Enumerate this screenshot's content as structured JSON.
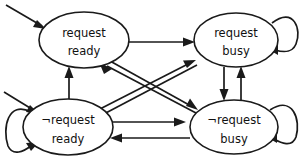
{
  "diagram": {
    "type": "state-transition-diagram",
    "background_color": "#ffffff",
    "stroke_color": "#1a1a1a",
    "canvas": {
      "width": 304,
      "height": 166
    },
    "negation_symbol": "¬",
    "states": [
      {
        "id": "request-ready",
        "line1": "request",
        "line2": "ready",
        "cx": 84,
        "cy": 40,
        "rx": 45,
        "ry": 28,
        "initial": true,
        "self_loop": false
      },
      {
        "id": "request-busy",
        "line1": "request",
        "line2": "busy",
        "cx": 236,
        "cy": 40,
        "rx": 42,
        "ry": 27,
        "initial": false,
        "self_loop": true,
        "self_loop_side": "right"
      },
      {
        "id": "not-request-ready",
        "line1": "¬request",
        "line2": "ready",
        "cx": 68,
        "cy": 127,
        "rx": 45,
        "ry": 28,
        "initial": true,
        "self_loop": true,
        "self_loop_side": "left"
      },
      {
        "id": "not-request-busy",
        "line1": "¬request",
        "line2": "busy",
        "cx": 234,
        "cy": 127,
        "rx": 44,
        "ry": 27,
        "initial": false,
        "self_loop": true,
        "self_loop_side": "right"
      }
    ],
    "transitions": [
      {
        "from": "request-ready",
        "to": "request-busy",
        "shape": "horizontal-top"
      },
      {
        "from": "not-request-ready",
        "to": "not-request-busy",
        "shape": "horizontal-bottom-upper"
      },
      {
        "from": "not-request-busy",
        "to": "not-request-ready",
        "shape": "horizontal-bottom-lower"
      },
      {
        "from": "not-request-ready",
        "to": "request-ready",
        "shape": "vertical-left"
      },
      {
        "from": "request-busy",
        "to": "not-request-busy",
        "shape": "vertical-right-down"
      },
      {
        "from": "not-request-busy",
        "to": "request-busy",
        "shape": "vertical-right-up"
      },
      {
        "from": "request-ready",
        "to": "not-request-busy",
        "shape": "diagonal-down-right"
      },
      {
        "from": "not-request-ready",
        "to": "request-busy",
        "shape": "diagonal-up-right"
      },
      {
        "from": "not-request-busy",
        "to": "request-ready",
        "shape": "diagonal-up-left"
      },
      {
        "from": "request-busy",
        "to": "not-request-ready",
        "shape": "diagonal-down-left"
      },
      {
        "from": "request-busy",
        "to": "request-busy",
        "shape": "self-loop"
      },
      {
        "from": "not-request-ready",
        "to": "not-request-ready",
        "shape": "self-loop"
      },
      {
        "from": "not-request-busy",
        "to": "not-request-busy",
        "shape": "self-loop"
      }
    ],
    "initial_arrows": [
      {
        "target": "request-ready",
        "direction": "from-upper-left"
      },
      {
        "target": "not-request-ready",
        "direction": "from-upper-left"
      }
    ]
  }
}
